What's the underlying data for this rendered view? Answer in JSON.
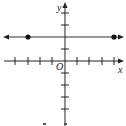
{
  "graph": {
    "x_axis_label": "x",
    "y_axis_label": "y",
    "origin_label": "O",
    "x_ticks": [
      -4,
      -3,
      -2,
      -1,
      1,
      2,
      3,
      4
    ],
    "y_ticks": [
      4,
      3,
      2,
      1,
      -1,
      -2,
      -3,
      -4,
      -5
    ],
    "line": {
      "type": "horizontal",
      "y": 2,
      "points": [
        {
          "x": -3,
          "y": 2
        },
        {
          "x": 4,
          "y": 2
        }
      ],
      "arrows": "both"
    },
    "colors": {
      "axis": "#222222",
      "line": "#333333",
      "point": "#111111"
    }
  }
}
